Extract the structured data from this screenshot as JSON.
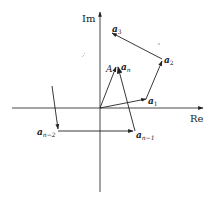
{
  "diagram": {
    "type": "complex-plane-vector-polygon",
    "axes": {
      "x_label": "Re",
      "y_label": "Im"
    },
    "labels": {
      "a1": {
        "base": "a",
        "sub": "1"
      },
      "a2": {
        "base": "a",
        "sub": "2"
      },
      "a3": {
        "base": "a",
        "sub": "3"
      },
      "an": {
        "base": "a",
        "sub": "n"
      },
      "an1": {
        "base": "a",
        "sub": "n−1"
      },
      "an2": {
        "base": "a",
        "sub": "n−2"
      },
      "A": "A"
    },
    "colors": {
      "line": "#222222",
      "axis": "#333333",
      "background": "#ffffff"
    }
  }
}
